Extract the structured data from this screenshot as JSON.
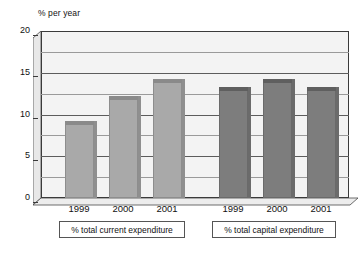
{
  "chart_data": {
    "type": "bar",
    "title": "",
    "subtitle": "",
    "xlabel": "",
    "ylabel": "% per year",
    "ylim": [
      0,
      20
    ],
    "yticks": [
      0,
      5,
      10,
      15,
      20
    ],
    "ytick_labels": [
      "0",
      "5",
      "10",
      "15",
      "20"
    ],
    "minor_gridlines": [
      2.5,
      7.5,
      12.5,
      17.5
    ],
    "grid": true,
    "legend": "none",
    "categories": [
      "1999",
      "2000",
      "2001",
      "1999",
      "2000",
      "2001"
    ],
    "values": [
      9.2,
      12.2,
      14.2,
      13.3,
      14.2,
      13.3
    ],
    "groups": [
      {
        "label": "% total current expenditure",
        "color": "#a9a9a9",
        "categories": [
          "1999",
          "2000",
          "2001"
        ],
        "values": [
          9.2,
          12.2,
          14.2
        ]
      },
      {
        "label": "% total capital expenditure",
        "color": "#7d7d7d",
        "categories": [
          "1999",
          "2000",
          "2001"
        ],
        "values": [
          13.3,
          14.2,
          13.3
        ]
      }
    ]
  },
  "axis": {
    "unit_caption": "% per year",
    "ticks": [
      {
        "label": "20",
        "value": 20
      },
      {
        "label": "15",
        "value": 15
      },
      {
        "label": "10",
        "value": 10
      },
      {
        "label": "5",
        "value": 5
      },
      {
        "label": "0",
        "value": 0
      }
    ]
  },
  "bars": [
    {
      "year": "1999",
      "value": 9.2,
      "group": "current"
    },
    {
      "year": "2000",
      "value": 12.2,
      "group": "current"
    },
    {
      "year": "2001",
      "value": 14.2,
      "group": "current"
    },
    {
      "year": "1999",
      "value": 13.3,
      "group": "capital"
    },
    {
      "year": "2000",
      "value": 14.2,
      "group": "capital"
    },
    {
      "year": "2001",
      "value": 13.3,
      "group": "capital"
    }
  ],
  "xticks": [
    "1999",
    "2000",
    "2001",
    "1999",
    "2000",
    "2001"
  ],
  "group_labels": [
    "% total current expenditure",
    "% total capital expenditure"
  ],
  "colors": {
    "bar_light": "#a9a9a9",
    "bar_light_cap": "#8a8a8a",
    "bar_dark": "#7d7d7d",
    "bar_dark_cap": "#5f5f5f",
    "plot_background": "#f3f3f3",
    "axis_line": "#3a3a3a",
    "gridline": "#5c5c5c",
    "page_background": "#ffffff"
  }
}
